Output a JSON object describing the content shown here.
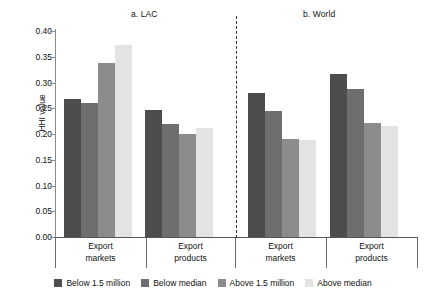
{
  "chart_data": {
    "type": "bar",
    "title": "",
    "xlabel": "",
    "ylabel": "HHI value",
    "ylim": [
      0.0,
      0.4
    ],
    "ytick_values": [
      0.0,
      0.05,
      0.1,
      0.15,
      0.2,
      0.25,
      0.3,
      0.35,
      0.4
    ],
    "ytick_labels": [
      "0.00",
      "0.05",
      "0.10",
      "0.15",
      "0.20",
      "0.25",
      "0.30",
      "0.35",
      "0.40"
    ],
    "grid": false,
    "legend_position": "bottom",
    "panels": [
      {
        "title": "a. LAC",
        "categories": [
          "Export markets",
          "Export products"
        ],
        "series": [
          {
            "name": "Below 1.5 million",
            "color": "#4d4d4d",
            "values": [
              0.268,
              0.246
            ]
          },
          {
            "name": "Below median",
            "color": "#6e6e6e",
            "values": [
              0.261,
              0.22
            ]
          },
          {
            "name": "Above 1.5 million",
            "color": "#8c8c8c",
            "values": [
              0.338,
              0.2
            ]
          },
          {
            "name": "Above median",
            "color": "#e3e3e3",
            "values": [
              0.373,
              0.212
            ]
          }
        ]
      },
      {
        "title": "b. World",
        "categories": [
          "Export markets",
          "Export products"
        ],
        "series": [
          {
            "name": "Below 1.5 million",
            "color": "#4d4d4d",
            "values": [
              0.28,
              0.317
            ]
          },
          {
            "name": "Below median",
            "color": "#6e6e6e",
            "values": [
              0.244,
              0.287
            ]
          },
          {
            "name": "Above 1.5 million",
            "color": "#8c8c8c",
            "values": [
              0.19,
              0.222
            ]
          },
          {
            "name": "Above median",
            "color": "#e3e3e3",
            "values": [
              0.188,
              0.215
            ]
          }
        ]
      }
    ],
    "legend": [
      {
        "label": "Below 1.5 million",
        "color": "#4d4d4d"
      },
      {
        "label": "Below median",
        "color": "#6e6e6e"
      },
      {
        "label": "Above 1.5 million",
        "color": "#8c8c8c"
      },
      {
        "label": "Above median",
        "color": "#e3e3e3"
      }
    ]
  }
}
